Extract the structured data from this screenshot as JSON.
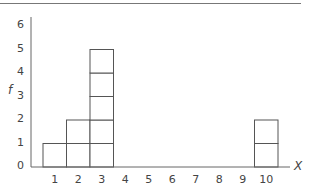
{
  "chart_data": {
    "type": "bar",
    "subtype": "frequency-histogram-stacked-units",
    "title": "",
    "xlabel": "X",
    "ylabel": "f",
    "categories": [
      "1",
      "2",
      "3",
      "4",
      "5",
      "6",
      "7",
      "8",
      "9",
      "10"
    ],
    "values": [
      1,
      2,
      5,
      0,
      0,
      0,
      0,
      0,
      0,
      2
    ],
    "x_ticks": [
      "1",
      "2",
      "3",
      "4",
      "5",
      "6",
      "7",
      "8",
      "9",
      "10"
    ],
    "y_ticks": [
      "0",
      "1",
      "2",
      "3",
      "4",
      "5",
      "6"
    ],
    "ylim": [
      0,
      6
    ],
    "xlim": [
      0.5,
      10.5
    ],
    "grid": false,
    "legend": null,
    "colors": {
      "stroke": "#555555",
      "fill": "#ffffff",
      "axis": "#666666"
    }
  },
  "labels": {
    "xlabel": "X",
    "ylabel": "f",
    "y_ticks": [
      "0",
      "1",
      "2",
      "3",
      "4",
      "5",
      "6"
    ],
    "x_ticks": [
      "1",
      "2",
      "3",
      "4",
      "5",
      "6",
      "7",
      "8",
      "9",
      "10"
    ]
  }
}
